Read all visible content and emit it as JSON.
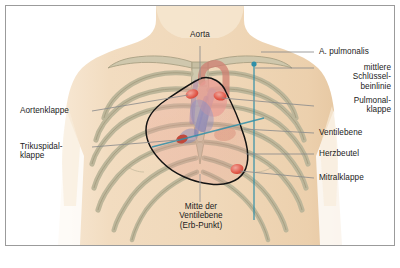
{
  "figure": {
    "kind": "anatomical-diagram",
    "colors": {
      "page_background": "#ffffff",
      "frame_border": "#9b9b9b",
      "skin": "#f2dcc0",
      "skin_shadow": "#e7c9a4",
      "bone": "#c9c3a8",
      "bone_outline": "#9d9madd",
      "heart_outline": "#131313",
      "valve_red": "#e2594a",
      "valve_pink": "#e79a92",
      "vessel_blue": "#6f7fbe",
      "vessel_purple": "#8a7fb5",
      "guide_line": "#2f8fa8",
      "leader_line": "#8c8c8c",
      "text": "#1b1b1b"
    }
  },
  "labels": {
    "aorta": {
      "text": "Aorta",
      "side": "top"
    },
    "a_pulmonalis": {
      "text": "A. pulmonalis",
      "side": "right"
    },
    "mittlere_schluesselbeinlinie": {
      "text": "mittlere\nSchlüssel-\nbeinlinie",
      "side": "right"
    },
    "pulmonalklappe": {
      "text": "Pulmonal-\nklappe",
      "side": "right"
    },
    "ventilebene": {
      "text": "Ventilebene",
      "side": "right"
    },
    "herzbeutel": {
      "text": "Herzbeutel",
      "side": "right"
    },
    "mitralklappe": {
      "text": "Mitralklappe",
      "side": "right"
    },
    "aortenklappe": {
      "text": "Aortenklappe",
      "side": "left"
    },
    "trikuspidalklappe": {
      "text": "Trikuspidal-\nklappe",
      "side": "left"
    },
    "mitte_der_ventilebene": {
      "text": "Mitte der\nVentilebene\n(Erb-Punkt)",
      "side": "bottom"
    }
  }
}
